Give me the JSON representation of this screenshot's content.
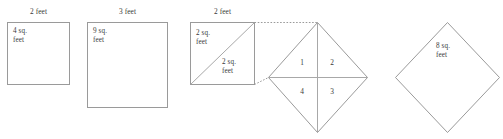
{
  "figure": {
    "stroke_color": "#9a9a9a",
    "text_color": "#3a3a3a",
    "background": "#ffffff",
    "shapes": [
      {
        "id": "square-2ft",
        "kind": "square",
        "dimension_label": "2 feet",
        "area_label": "4 sq.\nfeet"
      },
      {
        "id": "square-3ft",
        "kind": "square",
        "dimension_label": "3 feet",
        "area_label": "9 sq.\nfeet"
      },
      {
        "id": "square-2ft-split",
        "kind": "square-with-diagonal",
        "dimension_label": "2 feet",
        "upper_triangle_label": "2 sq.\nfeet",
        "lower_triangle_label": "2 sq.\nfeet"
      },
      {
        "id": "diamond-quartered",
        "kind": "rotated-square-quartered",
        "quadrant_labels": [
          "1",
          "2",
          "3",
          "4"
        ]
      },
      {
        "id": "diamond-8sqft",
        "kind": "rotated-square",
        "area_label": "8 sq.\nfeet"
      }
    ]
  }
}
